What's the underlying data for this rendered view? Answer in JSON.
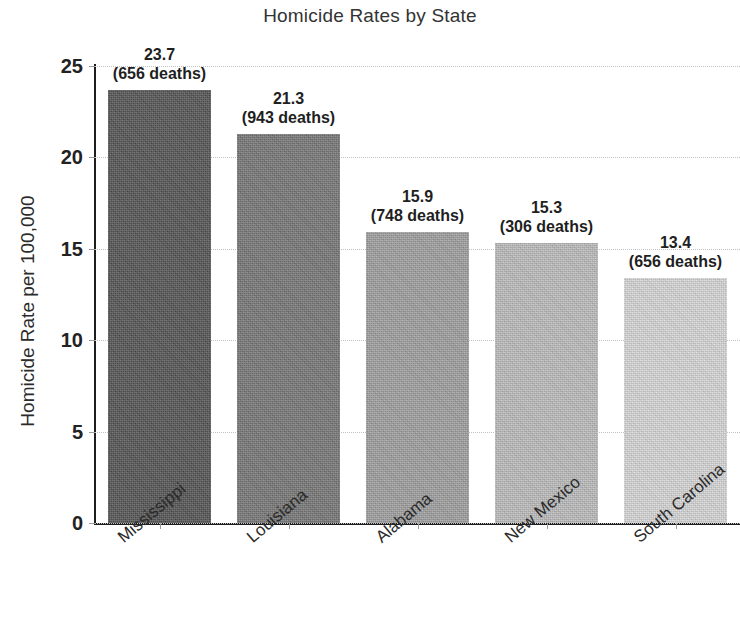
{
  "chart_data": {
    "type": "bar",
    "title": "Homicide Rates by State",
    "xlabel": "",
    "ylabel": "Homicide Rate per 100,000",
    "categories": [
      "Mississippi",
      "Louisiana",
      "Alabama",
      "New Mexico",
      "South Carolina"
    ],
    "values": [
      23.7,
      21.3,
      15.9,
      15.3,
      13.4
    ],
    "value_labels": [
      "23.7",
      "21.3",
      "15.9",
      "15.3",
      "13.4"
    ],
    "deaths": [
      656,
      943,
      748,
      306,
      656
    ],
    "deaths_labels": [
      "(656 deaths)",
      "(943 deaths)",
      "(748 deaths)",
      "(306 deaths)",
      "(656 deaths)"
    ],
    "bar_colors": [
      "#555555",
      "#777777",
      "#a0a0a0",
      "#bdbdbd",
      "#d7d7d7"
    ],
    "ylim": [
      0,
      25
    ],
    "yticks": [
      0,
      5,
      10,
      15,
      20,
      25
    ],
    "ytick_labels": [
      "0",
      "5",
      "10",
      "15",
      "20",
      "25"
    ],
    "grid": true,
    "grid_style": "dotted",
    "grid_color": "#c2c2c2",
    "legend": "none",
    "background": "#ffffff",
    "text_color": "#2b2b2b"
  }
}
